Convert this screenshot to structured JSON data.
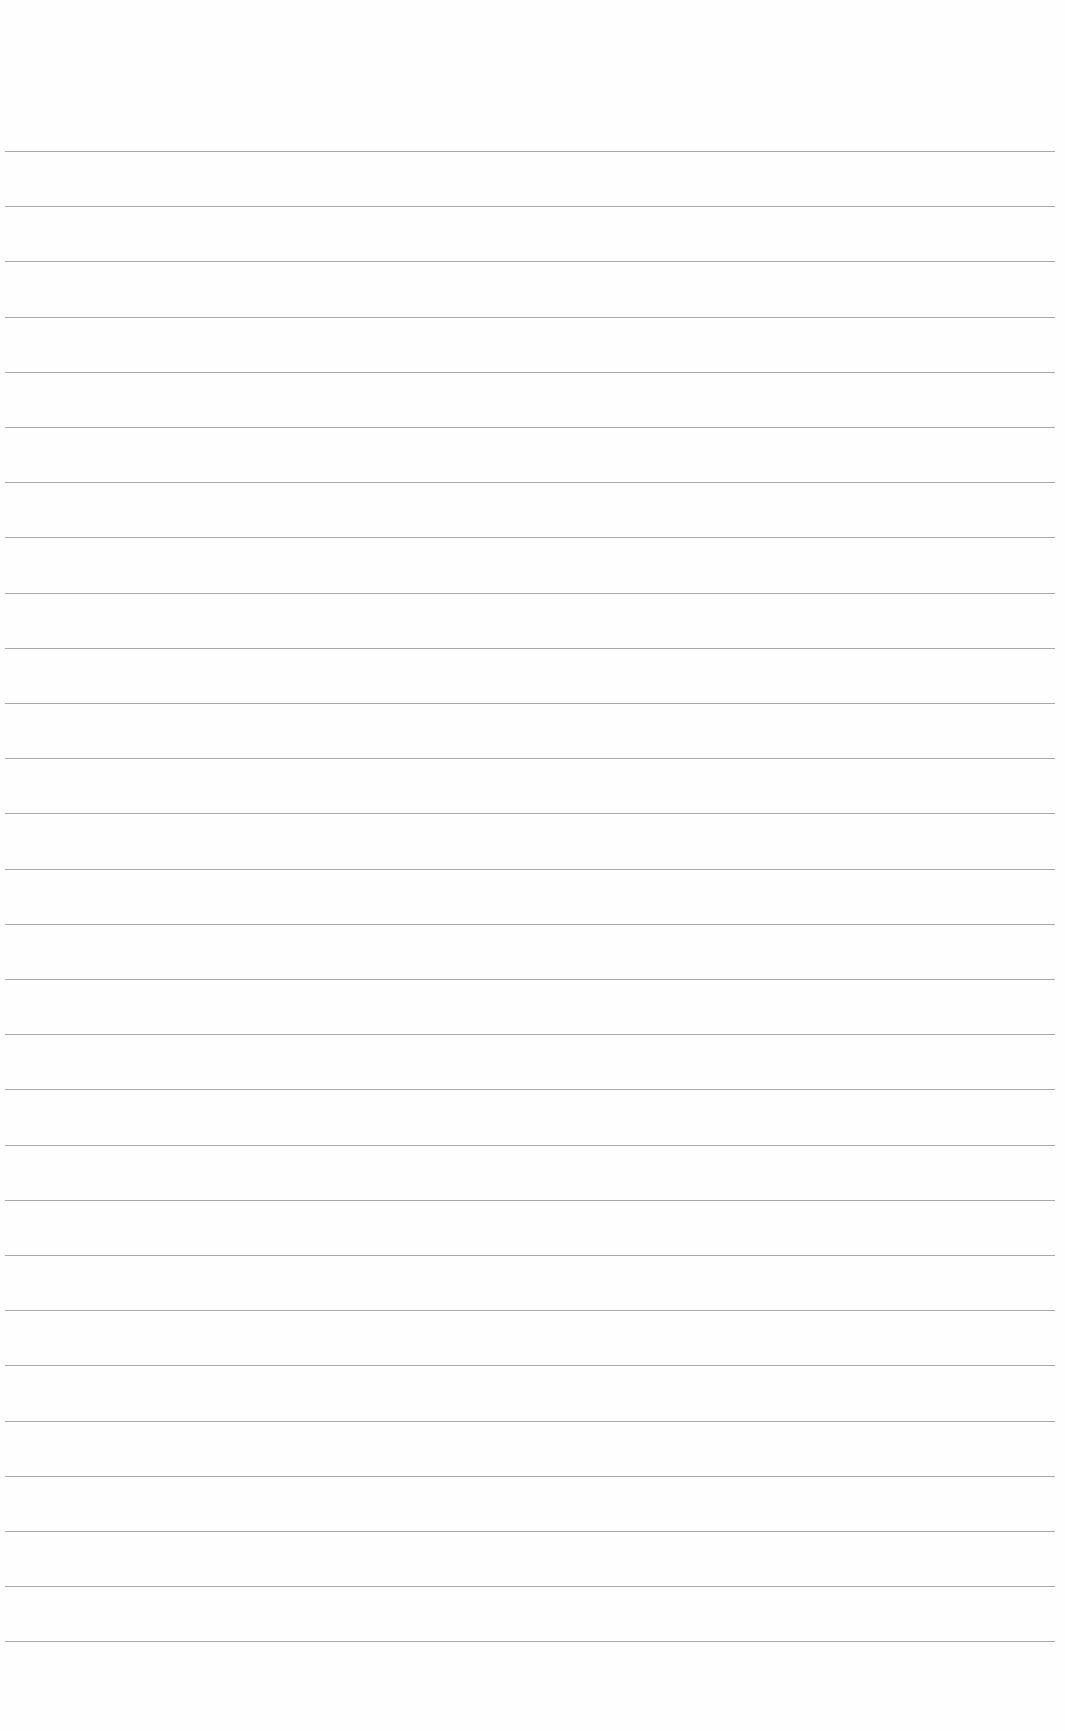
{
  "document": {
    "type": "lined paper",
    "line_count": 28,
    "first_line_y": 151,
    "line_spacing": 55.2,
    "line_left": 5,
    "line_width": 1050,
    "line_color": "#9a9a9a",
    "paper_color": "#fefefe"
  }
}
